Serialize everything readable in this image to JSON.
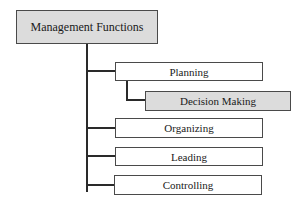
{
  "diagram": {
    "root": {
      "label": "Management Functions",
      "shaded": true
    },
    "children": [
      {
        "label": "Planning",
        "shaded": false,
        "children": [
          {
            "label": "Decision Making",
            "shaded": true
          }
        ]
      },
      {
        "label": "Organizing",
        "shaded": false
      },
      {
        "label": "Leading",
        "shaded": false
      },
      {
        "label": "Controlling",
        "shaded": false
      }
    ]
  },
  "colors": {
    "shaded_fill": "#dcdcdc",
    "border": "#4a4a4a",
    "connector": "#2a2a2a"
  }
}
